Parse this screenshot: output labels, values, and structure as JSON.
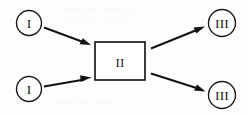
{
  "diagram": {
    "type": "flow-diagram",
    "title": "",
    "width": 249,
    "height": 114,
    "background_color": "#fdfdfd",
    "stroke_color": "#111111",
    "text_color": "#1a1a1a",
    "nodes": [
      {
        "id": "input-top",
        "label": "I",
        "shape": "circle",
        "cx": 29,
        "cy": 23,
        "r": 12.5
      },
      {
        "id": "input-bottom",
        "label": "I",
        "shape": "circle",
        "cx": 29,
        "cy": 89,
        "r": 12.5
      },
      {
        "id": "process",
        "label": "II",
        "shape": "rectangle",
        "x": 95,
        "y": 42,
        "width": 50,
        "height": 38
      },
      {
        "id": "output-top",
        "label": "III",
        "shape": "circle",
        "cx": 222,
        "cy": 23,
        "r": 13.5
      },
      {
        "id": "output-bottom",
        "label": "III",
        "shape": "circle",
        "cx": 222,
        "cy": 95,
        "r": 13.5
      }
    ],
    "edges": [
      {
        "id": "edge-input-top-to-process",
        "from": "input-top",
        "to": "process",
        "x1": 44,
        "y1": 27,
        "x2": 90,
        "y2": 44,
        "arrowhead": "solid-triangle"
      },
      {
        "id": "edge-input-bottom-to-process",
        "from": "input-bottom",
        "to": "process",
        "x1": 44,
        "y1": 86,
        "x2": 90,
        "y2": 78,
        "arrowhead": "solid-triangle"
      },
      {
        "id": "edge-process-to-output-top",
        "from": "process",
        "to": "output-top",
        "x1": 152,
        "y1": 48,
        "x2": 205,
        "y2": 27,
        "arrowhead": "solid-triangle"
      },
      {
        "id": "edge-process-to-output-bottom",
        "from": "process",
        "to": "output-bottom",
        "x1": 152,
        "y1": 74,
        "x2": 205,
        "y2": 92,
        "arrowhead": "solid-triangle"
      }
    ]
  }
}
